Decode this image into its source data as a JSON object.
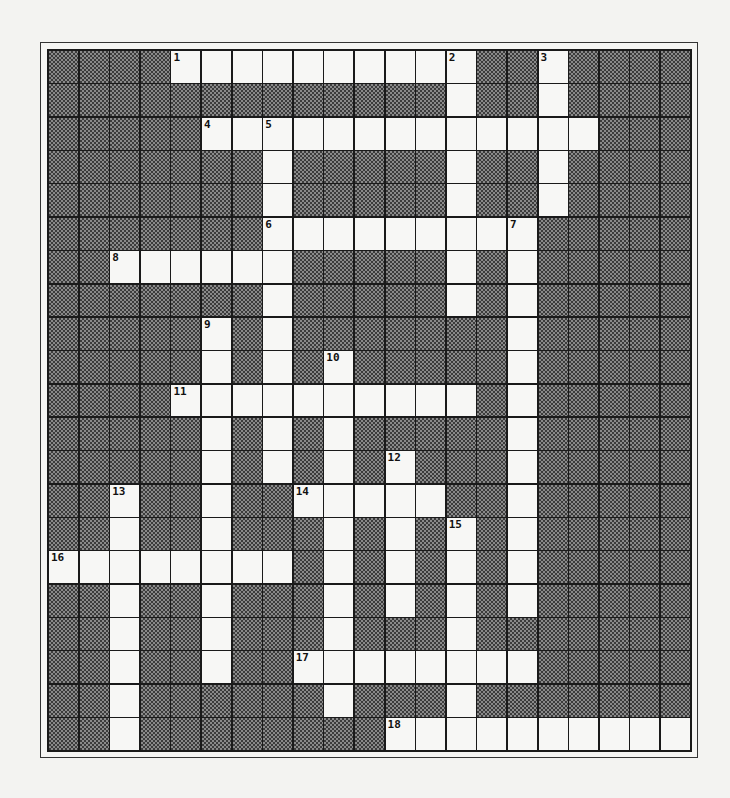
{
  "puzzle": {
    "rows": 21,
    "cols": 21,
    "colors": {
      "background": "#f3f3f1",
      "white_cell": "#f7f7f5",
      "dark_cell_base": "#8a8a8a",
      "dark_cell_dither": "#3c3c3c",
      "grid_lines": "#1a1a1a"
    },
    "white_cells": {
      "0": [
        4,
        5,
        6,
        7,
        8,
        9,
        10,
        11,
        12,
        13,
        16
      ],
      "1": [
        13,
        16
      ],
      "2": [
        5,
        6,
        7,
        8,
        9,
        10,
        11,
        12,
        13,
        14,
        15,
        16,
        17
      ],
      "3": [
        7,
        13,
        16
      ],
      "4": [
        7,
        13,
        16
      ],
      "5": [
        7,
        8,
        9,
        10,
        11,
        12,
        13,
        14,
        15
      ],
      "6": [
        2,
        3,
        4,
        5,
        6,
        7,
        13,
        15
      ],
      "7": [
        7,
        13,
        15
      ],
      "8": [
        5,
        7,
        15
      ],
      "9": [
        5,
        7,
        9,
        15
      ],
      "10": [
        4,
        5,
        6,
        7,
        8,
        9,
        10,
        11,
        12,
        13,
        15
      ],
      "11": [
        5,
        7,
        9,
        15
      ],
      "12": [
        5,
        7,
        9,
        11,
        15
      ],
      "13": [
        2,
        5,
        8,
        9,
        10,
        11,
        12,
        15
      ],
      "14": [
        2,
        5,
        9,
        11,
        13,
        15
      ],
      "15": [
        0,
        1,
        2,
        3,
        4,
        5,
        6,
        7,
        9,
        11,
        13,
        15
      ],
      "16": [
        2,
        5,
        9,
        11,
        13,
        15
      ],
      "17": [
        2,
        5,
        9,
        13
      ],
      "18": [
        2,
        5,
        8,
        9,
        10,
        11,
        12,
        13,
        14,
        15
      ],
      "19": [
        2,
        9,
        13
      ],
      "20": [
        2,
        11,
        12,
        13,
        14,
        15,
        16,
        17,
        18,
        19,
        20
      ]
    },
    "clue_numbers": [
      {
        "row": 0,
        "col": 4,
        "label": "1"
      },
      {
        "row": 0,
        "col": 13,
        "label": "2"
      },
      {
        "row": 0,
        "col": 16,
        "label": "3"
      },
      {
        "row": 2,
        "col": 5,
        "label": "4"
      },
      {
        "row": 2,
        "col": 7,
        "label": "5"
      },
      {
        "row": 5,
        "col": 7,
        "label": "6"
      },
      {
        "row": 5,
        "col": 15,
        "label": "7"
      },
      {
        "row": 6,
        "col": 2,
        "label": "8"
      },
      {
        "row": 8,
        "col": 5,
        "label": "9"
      },
      {
        "row": 9,
        "col": 9,
        "label": "10"
      },
      {
        "row": 10,
        "col": 4,
        "label": "11"
      },
      {
        "row": 12,
        "col": 11,
        "label": "12"
      },
      {
        "row": 13,
        "col": 2,
        "label": "13"
      },
      {
        "row": 13,
        "col": 8,
        "label": "14"
      },
      {
        "row": 14,
        "col": 13,
        "label": "15"
      },
      {
        "row": 15,
        "col": 0,
        "label": "16"
      },
      {
        "row": 18,
        "col": 8,
        "label": "17"
      },
      {
        "row": 20,
        "col": 11,
        "label": "18"
      }
    ]
  }
}
